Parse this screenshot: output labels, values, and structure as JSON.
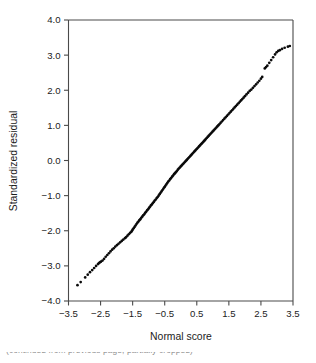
{
  "figure": {
    "caption_fragment": "(continued from previous page, partially cropped)"
  },
  "chart_data": {
    "type": "scatter",
    "title": "",
    "subtitle": "",
    "xlabel": "Normal score",
    "ylabel": "Standardized residual",
    "xlim": [
      -3.5,
      3.5
    ],
    "ylim": [
      -4.0,
      4.0
    ],
    "xticks": [
      -3.5,
      -2.5,
      -1.5,
      -0.5,
      0.5,
      1.5,
      2.5,
      3.5
    ],
    "xticklabels": [
      "−3.5",
      "−2.5",
      "−1.5",
      "−0.5",
      "0.5",
      "1.5",
      "2.5",
      "3.5"
    ],
    "yticks": [
      -4.0,
      -3.0,
      -2.0,
      -1.0,
      0.0,
      1.0,
      2.0,
      3.0,
      4.0
    ],
    "yticklabels": [
      "−4.0",
      "−3.0",
      "−2.0",
      "−1.0",
      "0.0",
      "1.0",
      "2.0",
      "3.0",
      "4.0"
    ],
    "grid": false,
    "legend": null,
    "marker": "point",
    "marker_color": "#0a0a0a",
    "marker_size": 1.35,
    "frame_color": "#4a4a4a",
    "background": "#ffffff",
    "annotations": [],
    "points": [
      [
        -3.22,
        -3.55
      ],
      [
        -3.12,
        -3.46
      ],
      [
        -2.98,
        -3.33
      ],
      [
        -2.9,
        -3.25
      ],
      [
        -2.83,
        -3.18
      ],
      [
        -2.76,
        -3.12
      ],
      [
        -2.7,
        -3.06
      ],
      [
        -2.64,
        -3.0
      ],
      [
        -2.58,
        -2.95
      ],
      [
        -2.55,
        -2.92
      ],
      [
        -2.52,
        -2.9
      ],
      [
        -2.49,
        -2.88
      ],
      [
        -2.44,
        -2.85
      ],
      [
        -2.39,
        -2.8
      ],
      [
        -2.34,
        -2.74
      ],
      [
        -2.29,
        -2.69
      ],
      [
        -2.24,
        -2.64
      ],
      [
        -2.19,
        -2.59
      ],
      [
        -2.14,
        -2.54
      ],
      [
        -2.09,
        -2.5
      ],
      [
        -2.04,
        -2.45
      ],
      [
        -1.99,
        -2.41
      ],
      [
        -1.94,
        -2.37
      ],
      [
        -1.89,
        -2.33
      ],
      [
        -1.84,
        -2.29
      ],
      [
        -1.79,
        -2.25
      ],
      [
        -1.74,
        -2.21
      ],
      [
        -1.7,
        -2.18
      ],
      [
        -1.66,
        -2.14
      ],
      [
        -1.62,
        -2.1
      ],
      [
        -1.58,
        -2.06
      ],
      [
        -1.54,
        -2.03
      ],
      [
        -1.52,
        -2.0
      ],
      [
        -1.5,
        -1.97
      ],
      [
        -1.47,
        -1.93
      ],
      [
        -1.44,
        -1.89
      ],
      [
        -1.41,
        -1.85
      ],
      [
        -1.38,
        -1.81
      ],
      [
        -1.35,
        -1.77
      ],
      [
        -1.32,
        -1.74
      ],
      [
        -1.29,
        -1.7
      ],
      [
        -1.26,
        -1.67
      ],
      [
        -1.23,
        -1.63
      ],
      [
        -1.2,
        -1.6
      ],
      [
        -1.17,
        -1.56
      ],
      [
        -1.14,
        -1.53
      ],
      [
        -1.11,
        -1.49
      ],
      [
        -1.08,
        -1.46
      ],
      [
        -1.05,
        -1.42
      ],
      [
        -1.02,
        -1.39
      ],
      [
        -0.99,
        -1.35
      ],
      [
        -0.96,
        -1.32
      ],
      [
        -0.93,
        -1.28
      ],
      [
        -0.9,
        -1.25
      ],
      [
        -0.87,
        -1.21
      ],
      [
        -0.84,
        -1.18
      ],
      [
        -0.81,
        -1.14
      ],
      [
        -0.78,
        -1.11
      ],
      [
        -0.75,
        -1.07
      ],
      [
        -0.72,
        -1.04
      ],
      [
        -0.69,
        -1.0
      ],
      [
        -0.66,
        -0.96
      ],
      [
        -0.63,
        -0.92
      ],
      [
        -0.6,
        -0.88
      ],
      [
        -0.57,
        -0.84
      ],
      [
        -0.54,
        -0.8
      ],
      [
        -0.51,
        -0.76
      ],
      [
        -0.48,
        -0.72
      ],
      [
        -0.45,
        -0.68
      ],
      [
        -0.42,
        -0.64
      ],
      [
        -0.39,
        -0.6
      ],
      [
        -0.36,
        -0.57
      ],
      [
        -0.33,
        -0.53
      ],
      [
        -0.3,
        -0.5
      ],
      [
        -0.27,
        -0.46
      ],
      [
        -0.24,
        -0.43
      ],
      [
        -0.21,
        -0.39
      ],
      [
        -0.18,
        -0.36
      ],
      [
        -0.15,
        -0.33
      ],
      [
        -0.12,
        -0.3
      ],
      [
        -0.09,
        -0.26
      ],
      [
        -0.06,
        -0.23
      ],
      [
        -0.03,
        -0.2
      ],
      [
        0.0,
        -0.17
      ],
      [
        0.03,
        -0.14
      ],
      [
        0.06,
        -0.11
      ],
      [
        0.09,
        -0.08
      ],
      [
        0.12,
        -0.05
      ],
      [
        0.15,
        -0.02
      ],
      [
        0.18,
        0.01
      ],
      [
        0.21,
        0.04
      ],
      [
        0.24,
        0.07
      ],
      [
        0.27,
        0.1
      ],
      [
        0.3,
        0.13
      ],
      [
        0.33,
        0.16
      ],
      [
        0.36,
        0.19
      ],
      [
        0.39,
        0.22
      ],
      [
        0.42,
        0.25
      ],
      [
        0.45,
        0.28
      ],
      [
        0.48,
        0.31
      ],
      [
        0.51,
        0.34
      ],
      [
        0.54,
        0.37
      ],
      [
        0.57,
        0.4
      ],
      [
        0.6,
        0.43
      ],
      [
        0.63,
        0.46
      ],
      [
        0.66,
        0.49
      ],
      [
        0.69,
        0.52
      ],
      [
        0.72,
        0.55
      ],
      [
        0.75,
        0.58
      ],
      [
        0.78,
        0.61
      ],
      [
        0.81,
        0.64
      ],
      [
        0.84,
        0.67
      ],
      [
        0.87,
        0.7
      ],
      [
        0.9,
        0.73
      ],
      [
        0.93,
        0.76
      ],
      [
        0.96,
        0.79
      ],
      [
        0.99,
        0.82
      ],
      [
        1.02,
        0.85
      ],
      [
        1.05,
        0.88
      ],
      [
        1.08,
        0.91
      ],
      [
        1.11,
        0.94
      ],
      [
        1.14,
        0.97
      ],
      [
        1.17,
        1.0
      ],
      [
        1.2,
        1.03
      ],
      [
        1.24,
        1.07
      ],
      [
        1.28,
        1.11
      ],
      [
        1.32,
        1.15
      ],
      [
        1.36,
        1.19
      ],
      [
        1.4,
        1.23
      ],
      [
        1.44,
        1.27
      ],
      [
        1.48,
        1.31
      ],
      [
        1.52,
        1.35
      ],
      [
        1.56,
        1.39
      ],
      [
        1.6,
        1.43
      ],
      [
        1.64,
        1.47
      ],
      [
        1.68,
        1.51
      ],
      [
        1.72,
        1.55
      ],
      [
        1.76,
        1.59
      ],
      [
        1.8,
        1.63
      ],
      [
        1.84,
        1.67
      ],
      [
        1.88,
        1.71
      ],
      [
        1.92,
        1.75
      ],
      [
        1.96,
        1.79
      ],
      [
        2.0,
        1.83
      ],
      [
        2.05,
        1.88
      ],
      [
        2.1,
        1.93
      ],
      [
        2.15,
        1.98
      ],
      [
        2.2,
        2.02
      ],
      [
        2.25,
        2.07
      ],
      [
        2.3,
        2.12
      ],
      [
        2.35,
        2.17
      ],
      [
        2.4,
        2.22
      ],
      [
        2.45,
        2.27
      ],
      [
        2.5,
        2.33
      ],
      [
        2.54,
        2.38
      ],
      [
        2.62,
        2.62
      ],
      [
        2.66,
        2.66
      ],
      [
        2.7,
        2.7
      ],
      [
        2.76,
        2.78
      ],
      [
        2.82,
        2.86
      ],
      [
        2.88,
        2.94
      ],
      [
        2.94,
        3.02
      ],
      [
        2.99,
        3.08
      ],
      [
        3.04,
        3.12
      ],
      [
        3.09,
        3.14
      ],
      [
        3.16,
        3.18
      ],
      [
        3.24,
        3.21
      ],
      [
        3.34,
        3.24
      ],
      [
        3.4,
        3.26
      ]
    ]
  }
}
